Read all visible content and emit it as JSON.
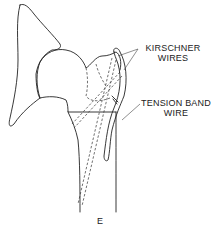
{
  "diagram": {
    "labels": {
      "kirschner": [
        "KIRSCHNER",
        "WIRES"
      ],
      "tension_band": [
        "TENSION BAND",
        "WIRE"
      ],
      "figure": "E"
    },
    "colors": {
      "line": "#222222",
      "background": "#ffffff"
    }
  }
}
